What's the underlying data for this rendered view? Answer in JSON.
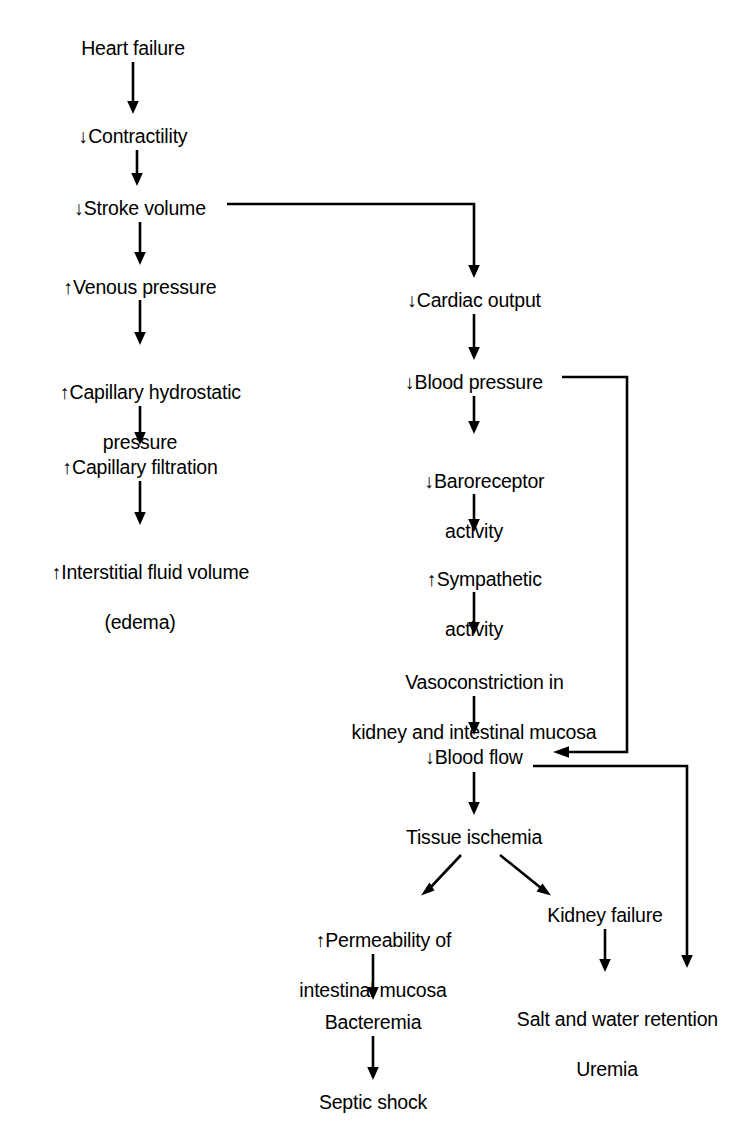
{
  "diagram": {
    "type": "flowchart",
    "background_color": "#ffffff",
    "stroke_color": "#000000",
    "text_color": "#000000"
  },
  "nodes": {
    "heart_failure": {
      "label": "Heart failure",
      "x": 133,
      "y": 36
    },
    "contractility": {
      "label": "↓Contractility",
      "x": 133,
      "y": 124
    },
    "stroke_volume": {
      "label": "↓Stroke volume",
      "x": 140,
      "y": 196
    },
    "venous_pressure": {
      "label": "↑Venous pressure",
      "x": 140,
      "y": 275
    },
    "capillary_hydrostatic_pressure_line1": {
      "label": "↑Capillary hydrostatic",
      "x": 140,
      "y": 355
    },
    "capillary_hydrostatic_pressure_line2": {
      "label": "pressure"
    },
    "capillary_filtration": {
      "label": "↑Capillary filtration",
      "x": 140,
      "y": 455
    },
    "interstitial_fluid_line1": {
      "label": "↑Interstitial fluid volume",
      "x": 140,
      "y": 535
    },
    "interstitial_fluid_line2": {
      "label": "(edema)"
    },
    "cardiac_output": {
      "label": "↓Cardiac output",
      "x": 474,
      "y": 288
    },
    "blood_pressure": {
      "label": "↓Blood pressure",
      "x": 474,
      "y": 370
    },
    "baroreceptor_line1": {
      "label": "↓Baroreceptor",
      "x": 474,
      "y": 444
    },
    "baroreceptor_line2": {
      "label": "activity"
    },
    "sympathetic_line1": {
      "label": "↑Sympathetic",
      "x": 474,
      "y": 542
    },
    "sympathetic_line2": {
      "label": "activity"
    },
    "vasoconstriction_line1": {
      "label": "Vasoconstriction in",
      "x": 474,
      "y": 645
    },
    "vasoconstriction_line2": {
      "label": "kidney and intestinal mucosa"
    },
    "blood_flow": {
      "label": "↓Blood flow",
      "x": 474,
      "y": 745
    },
    "tissue_ischemia": {
      "label": "Tissue ischemia",
      "x": 474,
      "y": 825
    },
    "permeability_line1": {
      "label": "↑Permeability of",
      "x": 373,
      "y": 903
    },
    "permeability_line2": {
      "label": "intestinal mucosa"
    },
    "bacteremia": {
      "label": "Bacteremia",
      "x": 373,
      "y": 1010
    },
    "septic_shock": {
      "label": "Septic shock",
      "x": 373,
      "y": 1090
    },
    "kidney_failure": {
      "label": "Kidney failure",
      "x": 605,
      "y": 903
    },
    "salt_water_line1": {
      "label": "Salt and water retention",
      "x": 607,
      "y": 982
    },
    "salt_water_line2": {
      "label": "Uremia"
    }
  },
  "connectors": [
    {
      "name": "heart-failure-to-contractility",
      "from": "Heart failure",
      "to": "↓Contractility",
      "style": "arrow"
    },
    {
      "name": "contractility-to-stroke-volume",
      "from": "↓Contractility",
      "to": "↓Stroke volume",
      "style": "arrow"
    },
    {
      "name": "stroke-volume-to-venous-pressure",
      "from": "↓Stroke volume",
      "to": "↑Venous pressure",
      "style": "arrow"
    },
    {
      "name": "stroke-volume-to-cardiac-output",
      "from": "↓Stroke volume",
      "to": "↓Cardiac output",
      "style": "elbow-arrow"
    },
    {
      "name": "venous-pressure-to-capillary-hydrostatic",
      "from": "↑Venous pressure",
      "to": "↑Capillary hydrostatic pressure",
      "style": "arrow"
    },
    {
      "name": "capillary-hydrostatic-to-capillary-filtration",
      "from": "↑Capillary hydrostatic pressure",
      "to": "↑Capillary filtration",
      "style": "arrow"
    },
    {
      "name": "capillary-filtration-to-interstitial-fluid",
      "from": "↑Capillary filtration",
      "to": "↑Interstitial fluid volume (edema)",
      "style": "arrow"
    },
    {
      "name": "cardiac-output-to-blood-pressure",
      "from": "↓Cardiac output",
      "to": "↓Blood pressure",
      "style": "arrow"
    },
    {
      "name": "blood-pressure-to-baroreceptor",
      "from": "↓Blood pressure",
      "to": "↓Baroreceptor activity",
      "style": "arrow"
    },
    {
      "name": "blood-pressure-to-blood-flow",
      "from": "↓Blood pressure",
      "to": "↓Blood flow",
      "style": "elbow-arrow"
    },
    {
      "name": "baroreceptor-to-sympathetic",
      "from": "↓Baroreceptor activity",
      "to": "↑Sympathetic activity",
      "style": "arrow"
    },
    {
      "name": "sympathetic-to-vasoconstriction",
      "from": "↑Sympathetic activity",
      "to": "Vasoconstriction in kidney and intestinal mucosa",
      "style": "arrow"
    },
    {
      "name": "vasoconstriction-to-blood-flow",
      "from": "Vasoconstriction in kidney and intestinal mucosa",
      "to": "↓Blood flow",
      "style": "arrow"
    },
    {
      "name": "blood-flow-to-tissue-ischemia",
      "from": "↓Blood flow",
      "to": "Tissue ischemia",
      "style": "arrow"
    },
    {
      "name": "blood-flow-to-salt-water-retention",
      "from": "↓Blood flow",
      "to": "Salt and water retention Uremia",
      "style": "elbow-arrow"
    },
    {
      "name": "tissue-ischemia-to-permeability",
      "from": "Tissue ischemia",
      "to": "↑Permeability of intestinal mucosa",
      "style": "diagonal-arrow"
    },
    {
      "name": "tissue-ischemia-to-kidney-failure",
      "from": "Tissue ischemia",
      "to": "Kidney failure",
      "style": "diagonal-arrow"
    },
    {
      "name": "permeability-to-bacteremia",
      "from": "↑Permeability of intestinal mucosa",
      "to": "Bacteremia",
      "style": "arrow"
    },
    {
      "name": "bacteremia-to-septic-shock",
      "from": "Bacteremia",
      "to": "Septic shock",
      "style": "arrow"
    },
    {
      "name": "kidney-failure-to-salt-water",
      "from": "Kidney failure",
      "to": "Salt and water retention",
      "style": "arrow"
    }
  ]
}
